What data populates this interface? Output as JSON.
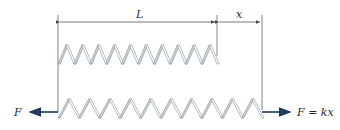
{
  "diagram": {
    "type": "spring-extension",
    "labels": {
      "length": "L",
      "extension": "x",
      "left_force": "F",
      "right_force": "F = kx"
    },
    "top_spring": {
      "state": "unstretched",
      "coils": 10,
      "x_start": 58,
      "x_end": 217,
      "y_top": 45,
      "y_bottom": 64
    },
    "bottom_spring": {
      "state": "stretched",
      "coils": 10,
      "x_start": 58,
      "x_end": 262,
      "y_top": 99,
      "y_bottom": 118
    },
    "dimension_line_y": 22,
    "force_arrow_y": 112,
    "colors": {
      "line": "#555555",
      "coil_fill": "#c9d3dc",
      "coil_stroke": "#8a8f96",
      "arrow": "#1f3a5a",
      "text": "#2a2a2a"
    }
  }
}
